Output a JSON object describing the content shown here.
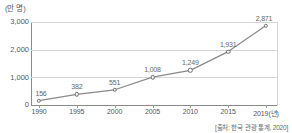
{
  "chart_data": {
    "type": "line",
    "title": "",
    "subtitle": "",
    "unit_label": "(만 명)",
    "xlabel": "",
    "ylabel": "",
    "categories": [
      "1990",
      "1995",
      "2000",
      "2005",
      "2010",
      "2015",
      "2019(년)"
    ],
    "x": [
      1990,
      1995,
      2000,
      2005,
      2010,
      2015,
      2019
    ],
    "values": [
      156,
      382,
      551,
      1008,
      1249,
      1931,
      2871
    ],
    "point_labels": [
      "156",
      "382",
      "551",
      "1,008",
      "1,249",
      "1,931",
      "2,871"
    ],
    "series": [
      {
        "name": "방한 외래 관광객 수",
        "values": [
          156,
          382,
          551,
          1008,
          1249,
          1931,
          2871
        ]
      }
    ],
    "ylim": [
      0,
      3000
    ],
    "yticks": [
      0,
      1000,
      2000,
      3000
    ],
    "ytick_labels": [
      "0",
      "1,000",
      "2,000",
      "3,000"
    ],
    "grid": true,
    "legend": false,
    "legend_position": "none",
    "marker": "open-circle",
    "line_color": "#8a8a8a",
    "marker_color": "#6e6e6e",
    "grid_color": "#d6d6d6",
    "axis_color": "#8a8a8a",
    "text_color": "#555555",
    "background": "#ffffff",
    "source_note": "[출처: 한국 관광 통계, 2020]",
    "annotations": []
  },
  "axis": {
    "unit": "(만 명)",
    "y_labels": [
      "3,000",
      "2,000",
      "1,000",
      "0"
    ],
    "x_labels": [
      "1990",
      "1995",
      "2000",
      "2005",
      "2010",
      "2015",
      "2019(년)"
    ]
  },
  "footer": {
    "source": "[출처: 한국 관광 통계, 2020]"
  }
}
